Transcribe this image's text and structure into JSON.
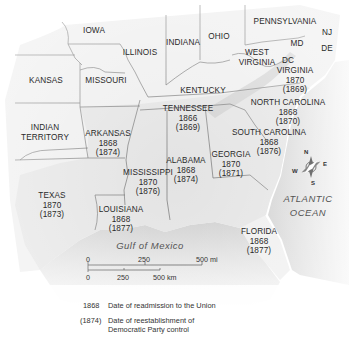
{
  "map": {
    "states": [
      {
        "name": "IOWA",
        "x": 94,
        "y": 27
      },
      {
        "name": "ILLINOIS",
        "x": 140,
        "y": 49
      },
      {
        "name": "INDIANA",
        "x": 183,
        "y": 39
      },
      {
        "name": "OHIO",
        "x": 219,
        "y": 33
      },
      {
        "name": "PENNSYLVANIA",
        "x": 280,
        "y": 19
      },
      {
        "name": "NJ",
        "x": 324,
        "y": 29
      },
      {
        "name": "MD",
        "x": 297,
        "y": 39
      },
      {
        "name": "DE",
        "x": 324,
        "y": 45
      },
      {
        "name": "WEST",
        "x": 256,
        "y": 49
      },
      {
        "name": "VIRGINIA",
        "x": 256,
        "y": 59
      },
      {
        "name": "DC",
        "x": 286,
        "y": 57
      },
      {
        "name": "KANSAS",
        "x": 46,
        "y": 77
      },
      {
        "name": "MISSOURI",
        "x": 105,
        "y": 77
      },
      {
        "name": "KENTUCKY",
        "x": 203,
        "y": 87
      },
      {
        "name": "INDIAN",
        "x": 45,
        "y": 124
      },
      {
        "name": "TERRITORY",
        "x": 45,
        "y": 134
      }
    ],
    "reconstruction_states": [
      {
        "name": "VIRGINIA",
        "readmission": "1870",
        "democratic_control": "(1869)",
        "x": 295,
        "y": 66
      },
      {
        "name": "NORTH CAROLINA",
        "readmission": "1868",
        "democratic_control": "(1870)",
        "x": 284,
        "y": 98
      },
      {
        "name": "TENNESSEE",
        "readmission": "1866",
        "democratic_control": "(1869)",
        "x": 188,
        "y": 104
      },
      {
        "name": "ARKANSAS",
        "readmission": "1868",
        "democratic_control": "(1874)",
        "x": 108,
        "y": 126
      },
      {
        "name": "SOUTH CAROLINA",
        "readmission": "1868",
        "democratic_control": "(1876)",
        "x": 268,
        "y": 126
      },
      {
        "name": "ALABAMA",
        "readmission": "1868",
        "democratic_control": "(1874)",
        "x": 154,
        "y": 157
      },
      {
        "name": "GEORGIA",
        "readmission": "1870",
        "democratic_control": "(1871)",
        "x": 227,
        "y": 151
      },
      {
        "name": "MISSISSIPPI",
        "readmission": "1870",
        "democratic_control": "(1876)",
        "x": 147,
        "y": 169
      },
      {
        "name": "TEXAS",
        "readmission": "1870",
        "democratic_control": "(1873)",
        "x": 52,
        "y": 190
      },
      {
        "name": "LOUISIANA",
        "readmission": "1868",
        "democratic_control": "(1877)",
        "x": 120,
        "y": 205
      },
      {
        "name": "FLORIDA",
        "readmission": "1868",
        "democratic_control": "(1877)",
        "x": 258,
        "y": 226
      }
    ],
    "water_bodies": [
      {
        "name": "ATLANTIC",
        "x": 305,
        "y": 196
      },
      {
        "name": "OCEAN",
        "x": 305,
        "y": 210
      },
      {
        "name": "Gulf of Mexico",
        "x": 150,
        "y": 241
      }
    ],
    "compass": {
      "n": "N",
      "e": "E",
      "s": "S",
      "w": "W"
    },
    "scale_bar": {
      "mi_labels": [
        "0",
        "250",
        "500 mi"
      ],
      "km_labels": [
        "0",
        "250",
        "500 km"
      ]
    },
    "legend": [
      {
        "key": "1868",
        "text": "Date of readmission to the Union"
      },
      {
        "key": "(1874)",
        "text": "Date of reestablishment of Democratic Party control"
      }
    ],
    "legend_lines": {
      "line2a": "Date of reestablishment of",
      "line2b": "Democratic Party control"
    }
  },
  "colors": {
    "land": "#efefef",
    "southern_land": "#e4e4e4",
    "water": "#d6d6d6",
    "border": "#6a6a6a",
    "text": "#2a2a2a"
  }
}
